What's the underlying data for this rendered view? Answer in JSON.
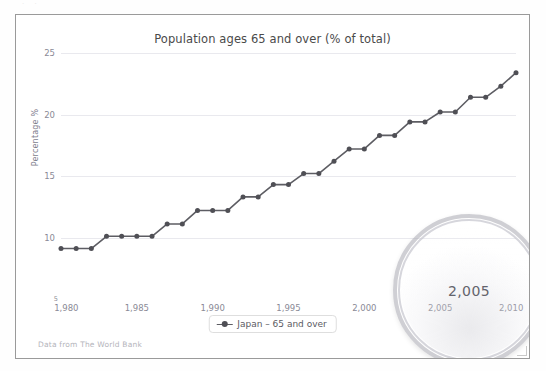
{
  "page": {
    "top_artifact_text": "·                                        ·"
  },
  "footer": {
    "source_note": "Data from The World Bank"
  },
  "legend": {
    "label": "Japan – 65 and over",
    "symbol": "line-marker-icon"
  },
  "magnifier": {
    "icon": "magnifier-lens",
    "magnified_label": "2,005"
  },
  "colors": {
    "line": "#5d5d63",
    "marker": "#4f4f55",
    "grid": "#e9e9ee",
    "tick_text": "#8a8a96",
    "title_text": "#4a4a4a",
    "frame_border": "#9a9a9a",
    "note_text": "#b4b4bb"
  },
  "chart_data": {
    "type": "line",
    "title": "Population ages 65 and over (% of total)",
    "xlabel": "",
    "ylabel": "Percentage %",
    "grid": true,
    "legend_position": "bottom-center",
    "xlim": [
      1980,
      2010
    ],
    "ylim": [
      5,
      25
    ],
    "ytick_labels": [
      "25",
      "20",
      "15",
      "10",
      "5"
    ],
    "ytick_values": [
      25,
      20,
      15,
      10,
      5
    ],
    "xtick_labels": [
      "1,980",
      "1,985",
      "1,990",
      "1,995",
      "2,000",
      "2,005",
      "2,010"
    ],
    "xtick_values": [
      1980,
      1985,
      1990,
      1995,
      2000,
      2005,
      2010
    ],
    "series": [
      {
        "name": "Japan – 65 and over",
        "x": [
          1980,
          1981,
          1982,
          1983,
          1984,
          1985,
          1986,
          1987,
          1988,
          1989,
          1990,
          1991,
          1992,
          1993,
          1994,
          1995,
          1996,
          1997,
          1998,
          1999,
          2000,
          2001,
          2002,
          2003,
          2004,
          2005,
          2006,
          2007,
          2008,
          2009,
          2010
        ],
        "values": [
          9.1,
          9.1,
          9.1,
          10.1,
          10.1,
          10.1,
          10.1,
          11.1,
          11.1,
          12.2,
          12.2,
          12.2,
          13.3,
          13.3,
          14.3,
          14.3,
          15.2,
          15.2,
          16.2,
          17.2,
          17.2,
          18.3,
          18.3,
          19.4,
          19.4,
          20.2,
          20.2,
          21.4,
          21.4,
          22.3,
          23.4
        ]
      }
    ]
  }
}
